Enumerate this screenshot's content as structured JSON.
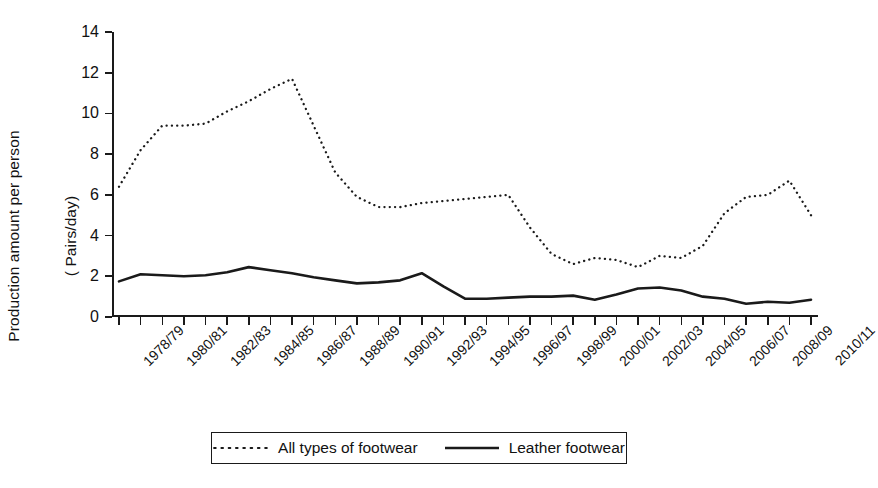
{
  "chart_data": {
    "type": "line",
    "title": "",
    "subtitle": "",
    "xlabel": "",
    "ylabel": "Production amount per person ( Pairs/day)",
    "ylabel_line1": "Production amount per person",
    "ylabel_line2": "( Pairs/day)",
    "ylim": [
      0,
      14
    ],
    "ytick_values": [
      0,
      2,
      4,
      6,
      8,
      10,
      12,
      14
    ],
    "ytick_labels": [
      "0",
      "2",
      "4",
      "6",
      "8",
      "10",
      "12",
      "14"
    ],
    "grid": false,
    "legend_position": "bottom-center",
    "x": [
      "1978/79",
      "1979/80",
      "1980/81",
      "1981/82",
      "1982/83",
      "1983/84",
      "1984/85",
      "1985/86",
      "1986/87",
      "1987/88",
      "1988/89",
      "1989/90",
      "1990/91",
      "1991/92",
      "1992/93",
      "1993/94",
      "1994/95",
      "1995/96",
      "1996/97",
      "1997/98",
      "1998/99",
      "1999/00",
      "2000/01",
      "2001/02",
      "2002/03",
      "2003/04",
      "2004/05",
      "2005/06",
      "2006/07",
      "2007/08",
      "2008/09",
      "2009/10",
      "2010/11"
    ],
    "xtick_labels": [
      "1978/79",
      "1980/81",
      "1982/83",
      "1984/85",
      "1986/87",
      "1988/89",
      "1990/91",
      "1992/93",
      "1994/95",
      "1996/97",
      "1998/99",
      "2000/01",
      "2002/03",
      "2004/05",
      "2006/07",
      "2008/09",
      "2010/11"
    ],
    "xtick_indices": [
      0,
      2,
      4,
      6,
      8,
      10,
      12,
      14,
      16,
      18,
      20,
      22,
      24,
      26,
      28,
      30,
      32
    ],
    "series": [
      {
        "name": "All types of footwear",
        "style": "dotted",
        "color": "#1a1a1a",
        "values": [
          6.4,
          8.2,
          9.4,
          9.4,
          9.5,
          10.1,
          10.6,
          11.2,
          11.7,
          9.4,
          7.1,
          5.9,
          5.4,
          5.4,
          5.6,
          5.7,
          5.8,
          5.9,
          6.0,
          4.4,
          3.1,
          2.6,
          2.9,
          2.8,
          2.45,
          3.0,
          2.9,
          3.5,
          5.1,
          5.9,
          6.0,
          6.7,
          5.0
        ]
      },
      {
        "name": "Leather footwear",
        "style": "solid",
        "color": "#1a1a1a",
        "values": [
          1.75,
          2.1,
          2.05,
          2.0,
          2.05,
          2.2,
          2.45,
          2.3,
          2.15,
          1.95,
          1.8,
          1.65,
          1.7,
          1.8,
          2.15,
          1.5,
          0.9,
          0.9,
          0.95,
          1.0,
          1.0,
          1.05,
          0.85,
          1.1,
          1.4,
          1.45,
          1.3,
          1.0,
          0.9,
          0.65,
          0.75,
          0.7,
          0.85
        ]
      }
    ],
    "series2_tail_note": ""
  },
  "legend": {
    "items": [
      {
        "label": "All types of footwear",
        "style": "dotted"
      },
      {
        "label": "Leather footwear",
        "style": "solid"
      }
    ]
  }
}
